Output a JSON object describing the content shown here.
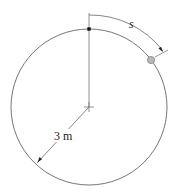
{
  "diagram": {
    "arc_label": "s",
    "radius_label": "3 m",
    "colors": {
      "line": "#555555",
      "ball_fill": "#b8b8b8",
      "ball_stroke": "#777777",
      "marker": "#111111"
    }
  }
}
